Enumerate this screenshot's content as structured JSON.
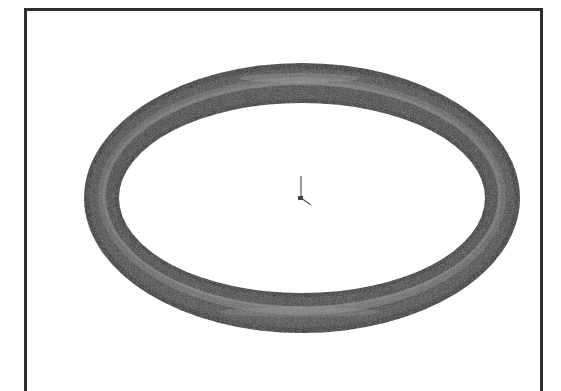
{
  "viewport": {
    "background": "#ffffff",
    "frame_color": "#2e2e2e"
  },
  "model": {
    "shape": "torus",
    "description": "O-ring / torus shaded 3D model, isometric view",
    "shade_dark": "#2a2a2a",
    "shade_mid": "#555555",
    "shade_light": "#9a9a9a"
  },
  "origin_triad": {
    "icon": "origin-triad-icon"
  }
}
